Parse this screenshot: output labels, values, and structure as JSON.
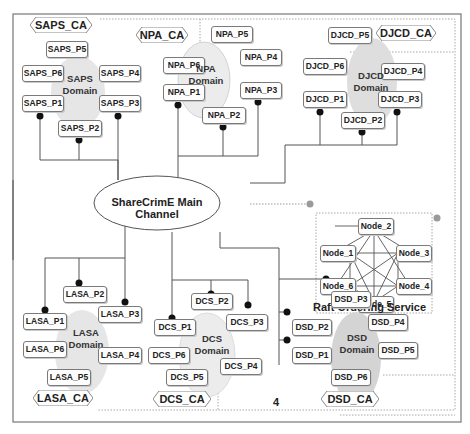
{
  "diagram": {
    "main_channel": {
      "label": "ShareCrimE Main Channel"
    },
    "raft": {
      "title": "Raft Ordering Service",
      "nodes": [
        "Node_1",
        "Node_2",
        "Node_3",
        "Node_4",
        "Node_5",
        "Node_6"
      ]
    },
    "page_number": "4",
    "domains": [
      {
        "id": "saps",
        "label_line1": "SAPS",
        "label_line2": "Domain",
        "ca": "SAPS_CA",
        "peers": [
          "SAPS_P1",
          "SAPS_P2",
          "SAPS_P3",
          "SAPS_P4",
          "SAPS_P5",
          "SAPS_P6"
        ]
      },
      {
        "id": "npa",
        "label_line1": "NPA",
        "label_line2": "Domain",
        "ca": "NPA_CA",
        "peers": [
          "NPA_P1",
          "NPA_P2",
          "NPA_P3",
          "NPA_P4",
          "NPA_P5",
          "NPA_P6"
        ]
      },
      {
        "id": "djcd",
        "label_line1": "DJCD",
        "label_line2": "Domain",
        "ca": "DJCD_CA",
        "peers": [
          "DJCD_P1",
          "DJCD_P2",
          "DJCD_P3",
          "DJCD_P4",
          "DJCD_P5",
          "DJCD_P6"
        ]
      },
      {
        "id": "lasa",
        "label_line1": "LASA",
        "label_line2": "Domain",
        "ca": "LASA_CA",
        "peers": [
          "LASA_P1",
          "LASA_P2",
          "LASA_P3",
          "LASA_P4",
          "LASA_P5",
          "LASA_P6"
        ]
      },
      {
        "id": "dcs",
        "label_line1": "DCS",
        "label_line2": "Domain",
        "ca": "DCS_CA",
        "peers": [
          "DCS_P1",
          "DCS_P2",
          "DCS_P3",
          "DCS_P4",
          "DCS_P5",
          "DCS_P6"
        ]
      },
      {
        "id": "dsd",
        "label_line1": "DSD",
        "label_line2": "Domain",
        "ca": "DSD_CA",
        "peers": [
          "DSD_P1",
          "DSD_P2",
          "DSD_P3",
          "DSD_P4",
          "DSD_P5",
          "DSD_P6"
        ]
      }
    ],
    "colors": {
      "domain_fill": "#e6e6e6",
      "dsd_domain_fill": "#d4d4d4",
      "line": "#555555",
      "dot": "#111111",
      "dotted_border": "#a8a8a8",
      "raft_dot": "#9a9a9a"
    }
  }
}
